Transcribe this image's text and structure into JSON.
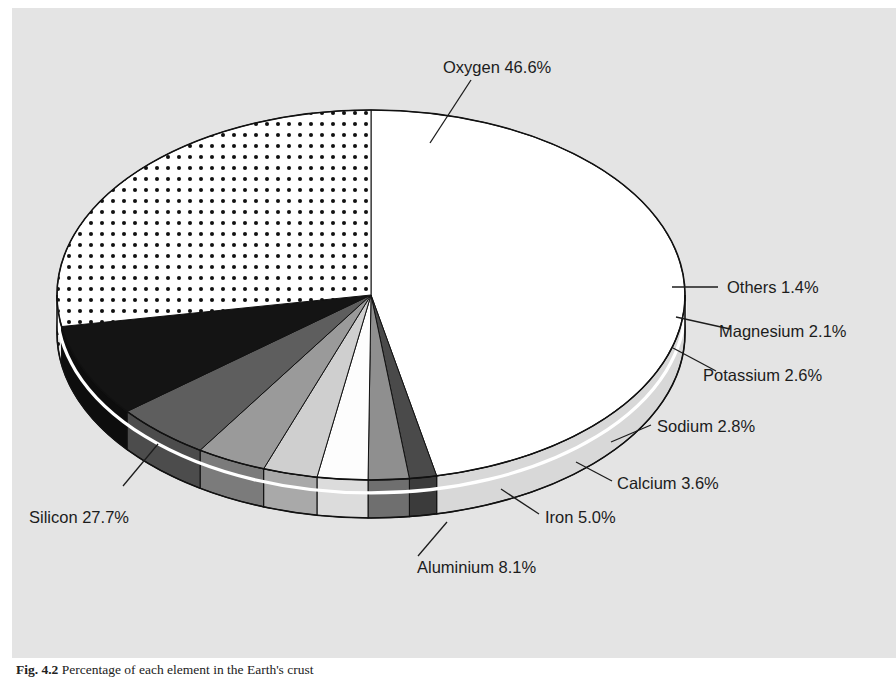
{
  "figure": {
    "caption_number": "Fig. 4.2",
    "caption_text": "Percentage of each element in the Earth's crust",
    "background_color": "#e4e4e4"
  },
  "chart_data": {
    "type": "pie",
    "title": "",
    "subtitle": "",
    "xlabel": "",
    "ylabel": "",
    "three_d": true,
    "start_angle_deg": 0,
    "direction": "clockwise",
    "grid": false,
    "legend_position": "callout-labels",
    "unit": "%",
    "categories": [
      "Oxygen",
      "Silicon",
      "Aluminium",
      "Iron",
      "Calcium",
      "Sodium",
      "Potassium",
      "Magnesium",
      "Others"
    ],
    "values": [
      46.6,
      27.7,
      8.1,
      5.0,
      3.6,
      2.8,
      2.6,
      2.1,
      1.4
    ],
    "total": 99.9,
    "slices": [
      {
        "label": "Oxygen 46.6%",
        "name": "Oxygen",
        "value": 46.6,
        "color": "#ffffff",
        "side_color": "#d8d8d8",
        "pattern": "none"
      },
      {
        "label": "Others 1.4%",
        "name": "Others",
        "value": 1.4,
        "color": "#4a4a4a",
        "side_color": "#3b3b3b",
        "pattern": "none"
      },
      {
        "label": "Magnesium 2.1%",
        "name": "Magnesium",
        "value": 2.1,
        "color": "#8f8f8f",
        "side_color": "#6f6f6f",
        "pattern": "none"
      },
      {
        "label": "Potassium 2.6%",
        "name": "Potassium",
        "value": 2.6,
        "color": "#fdfdfd",
        "side_color": "#dcdcdc",
        "pattern": "none"
      },
      {
        "label": "Sodium 2.8%",
        "name": "Sodium",
        "value": 2.8,
        "color": "#cfcfcf",
        "side_color": "#a9a9a9",
        "pattern": "none"
      },
      {
        "label": "Calcium 3.6%",
        "name": "Calcium",
        "value": 3.6,
        "color": "#9a9a9a",
        "side_color": "#7b7b7b",
        "pattern": "none"
      },
      {
        "label": "Iron 5.0%",
        "name": "Iron",
        "value": 5.0,
        "color": "#5e5e5e",
        "side_color": "#4c4c4c",
        "pattern": "none"
      },
      {
        "label": "Aluminium 8.1%",
        "name": "Aluminium",
        "value": 8.1,
        "color": "#141414",
        "side_color": "#0d0d0d",
        "pattern": "none"
      },
      {
        "label": "Silicon 27.7%",
        "name": "Silicon",
        "value": 27.7,
        "color": "#ffffff",
        "side_color": "#e0e0e0",
        "pattern": "dots"
      }
    ],
    "callouts": [
      {
        "key": "oxygen",
        "text": "Oxygen 46.6%",
        "anchor": "middle"
      },
      {
        "key": "others",
        "text": "Others 1.4%",
        "anchor": "start"
      },
      {
        "key": "magnesium",
        "text": "Magnesium 2.1%",
        "anchor": "start"
      },
      {
        "key": "potassium",
        "text": "Potassium 2.6%",
        "anchor": "start"
      },
      {
        "key": "sodium",
        "text": "Sodium 2.8%",
        "anchor": "start"
      },
      {
        "key": "calcium",
        "text": "Calcium 3.6%",
        "anchor": "start"
      },
      {
        "key": "iron",
        "text": "Iron 5.0%",
        "anchor": "start"
      },
      {
        "key": "aluminium",
        "text": "Aluminium 8.1%",
        "anchor": "start"
      },
      {
        "key": "silicon",
        "text": "Silicon 27.7%",
        "anchor": "start"
      }
    ]
  }
}
